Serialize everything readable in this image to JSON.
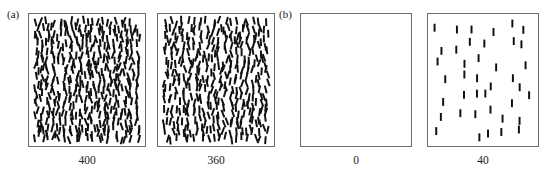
{
  "figure": {
    "background_color": "#ffffff",
    "panel_border_color": "#6e6e6e",
    "element_color": "#101010",
    "groups": [
      {
        "id": "a",
        "label": "(a)"
      },
      {
        "id": "b",
        "label": "(b)"
      }
    ]
  },
  "panels": [
    {
      "group": "a",
      "caption": "400",
      "count": 400,
      "x": 28,
      "y": 13,
      "width": 118,
      "height": 134,
      "element": {
        "length": 8,
        "width": 2,
        "angle_jitter_deg": 22,
        "base_angle_deg": 0
      }
    },
    {
      "group": "a",
      "caption": "360",
      "count": 360,
      "x": 157,
      "y": 13,
      "width": 118,
      "height": 134,
      "element": {
        "length": 8,
        "width": 2,
        "angle_jitter_deg": 22,
        "base_angle_deg": 0
      }
    },
    {
      "group": "b",
      "caption": "0",
      "count": 0,
      "x": 300,
      "y": 13,
      "width": 112,
      "height": 134,
      "element": {
        "length": 8,
        "width": 2,
        "angle_jitter_deg": 0,
        "base_angle_deg": 0
      }
    },
    {
      "group": "b",
      "caption": "40",
      "count": 40,
      "x": 427,
      "y": 13,
      "width": 112,
      "height": 134,
      "element": {
        "length": 8,
        "width": 2,
        "angle_jitter_deg": 0,
        "base_angle_deg": 0
      }
    }
  ],
  "chart_data": {
    "type": "scatter",
    "title": "",
    "xlabel": "",
    "ylabel": "",
    "categories": [
      "400",
      "360",
      "0",
      "40"
    ],
    "values": [
      400,
      360,
      0,
      40
    ],
    "series": [
      {
        "name": "element count",
        "values": [
          400,
          360,
          0,
          40
        ]
      }
    ],
    "groups": [
      "(a)",
      "(a)",
      "(b)",
      "(b)"
    ],
    "grid": false,
    "legend": "none"
  }
}
